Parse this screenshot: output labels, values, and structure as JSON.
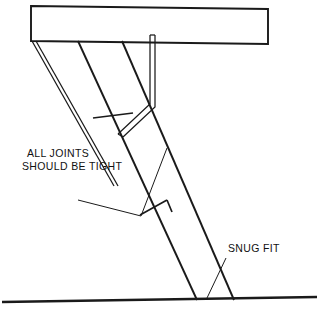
{
  "diagram": {
    "background_color": "#ffffff",
    "line_color": "#1a1a1a",
    "width": 319,
    "height": 309,
    "annotations": [
      {
        "id": "all-joints",
        "line1": "ALL JOINTS",
        "line2": "SHOULD BE TIGHT",
        "text_x": 27,
        "text_y": 157,
        "text_x2": 22,
        "text_y2": 170
      },
      {
        "id": "snug-fit",
        "line1": "SNUG FIT",
        "text_x": 228,
        "text_y": 252
      }
    ],
    "parts": {
      "beam_label": "horizontal-beam",
      "front_leg_label": "front-ladder-leg",
      "rear_brace_label": "rear-brace",
      "vertical_rod_label": "vertical-hook-rod",
      "ground_label": "ground-line"
    }
  }
}
